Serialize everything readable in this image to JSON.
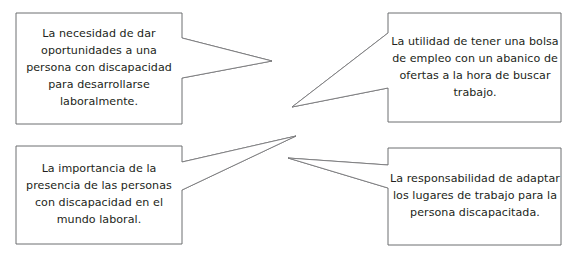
{
  "diagram": {
    "type": "callout-cluster",
    "background_color": "#ffffff",
    "border_color": "#6d6e70",
    "text_color": "#231f20",
    "callouts": [
      {
        "id": "callout-top-left",
        "position": "top-left",
        "tail_direction": "right",
        "text": "La necesidad de dar oportunidades a una persona con discapacidad para desarrollarse laboralmente."
      },
      {
        "id": "callout-top-right",
        "position": "top-right",
        "tail_direction": "left",
        "text": "La utilidad de tener una bolsa de empleo con un abanico de ofertas a la hora de buscar trabajo."
      },
      {
        "id": "callout-bottom-left",
        "position": "bottom-left",
        "tail_direction": "right",
        "text": "La importancia de la presencia de las personas con discapacidad en el mundo laboral."
      },
      {
        "id": "callout-bottom-right",
        "position": "bottom-right",
        "tail_direction": "left",
        "text": "La responsabilidad de adaptar los lugares de trabajo para la persona discapacitada."
      }
    ]
  }
}
